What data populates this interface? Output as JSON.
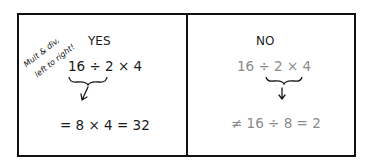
{
  "annotation": {
    "line1": "Mult & div,",
    "line2": "left to right!"
  },
  "yes_panel": {
    "heading": "YES",
    "expression": "16 ÷ 2 × 4",
    "result": "= 8 × 4 = 32"
  },
  "no_panel": {
    "heading": "NO",
    "expression": "16 ÷ 2 × 4",
    "result": "≠ 16 ÷ 8 = 2"
  },
  "colors": {
    "correct_text": "#1a1a1a",
    "incorrect_text": "#8a8a8a",
    "border": "#111111"
  }
}
